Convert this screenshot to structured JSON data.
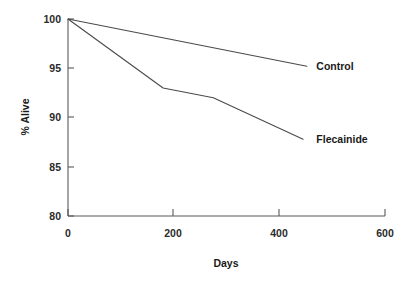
{
  "chart_data": {
    "type": "line",
    "title": "",
    "xlabel": "Days",
    "ylabel": "% Alive",
    "xlim": [
      0,
      600
    ],
    "ylim": [
      80,
      100
    ],
    "xticks": [
      0,
      200,
      400,
      600
    ],
    "yticks": [
      80,
      85,
      90,
      95,
      100
    ],
    "xtick_labels": [
      "0",
      "200",
      "400",
      "600"
    ],
    "ytick_labels": [
      "80",
      "85",
      "90",
      "95",
      "100"
    ],
    "grid": false,
    "legend": "inline-end-of-line",
    "series": [
      {
        "name": "Control",
        "label": "Control",
        "color": "#4a4a4a",
        "x": [
          0,
          452
        ],
        "y": [
          100,
          95.2
        ],
        "label_x": 470,
        "label_y": 95.4
      },
      {
        "name": "Flecainide",
        "label": "Flecainide",
        "color": "#4a4a4a",
        "x": [
          0,
          180,
          275,
          445
        ],
        "y": [
          100,
          93.0,
          92.0,
          87.8
        ],
        "label_x": 470,
        "label_y": 88.0
      }
    ]
  }
}
